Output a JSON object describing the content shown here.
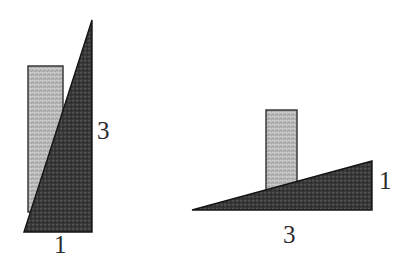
{
  "figure": {
    "background_color": "#ffffff",
    "colors": {
      "dark_fill": "#3a3a3a",
      "dark_fill_alt": "#4a4a4a",
      "light_fill": "#b4b4b4",
      "light_fill_alt": "#c6c6c6",
      "outline": "#1a1a1a",
      "label_color": "#2c2c2c"
    },
    "shapes": [
      {
        "name": "left-triangle",
        "type": "right-triangle",
        "orientation": "vertical",
        "fill": "dark",
        "points": "24,232 92,20 92,232",
        "base_label": "1",
        "height_label": "3"
      },
      {
        "name": "left-bar",
        "type": "rectangle",
        "fill": "light",
        "x": 28,
        "y": 66,
        "width": 35,
        "height": 146
      },
      {
        "name": "right-triangle",
        "type": "right-triangle",
        "orientation": "horizontal",
        "fill": "dark",
        "points": "192,210 372,161 372,210",
        "base_label": "3",
        "height_label": "1"
      },
      {
        "name": "right-bar",
        "type": "rectangle",
        "fill": "light",
        "x": 266,
        "y": 110,
        "width": 31,
        "height": 85
      }
    ]
  },
  "labels": {
    "left_height": "3",
    "left_base": "1",
    "right_height": "1",
    "right_base": "3"
  }
}
